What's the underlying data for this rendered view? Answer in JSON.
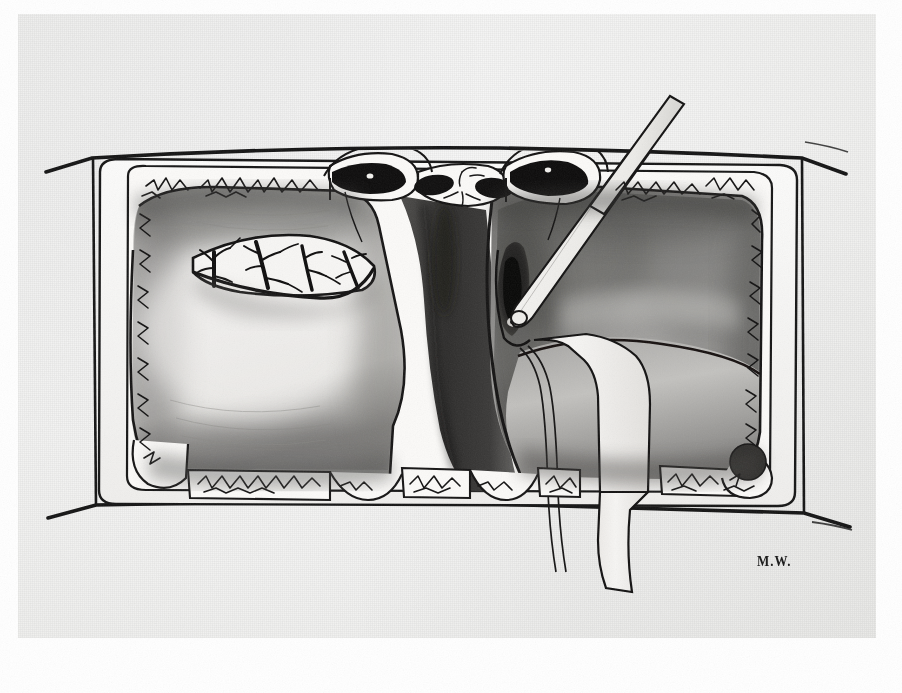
{
  "artwork": {
    "kind": "surgical-operative-illustration",
    "medium": "pen-and-ink wash drawing on textured paper",
    "signature": "M.W.",
    "signature_position": "lower-right",
    "background_color": "#f4f4f3",
    "ink_color": "#141414",
    "paper_tone": "#f2f2f0",
    "view": "operative field seen through a draped incision"
  },
  "scene": {
    "title": "Operative field exposure",
    "elements": [
      {
        "name": "surgical-drape-frame",
        "label": "Surgical drape / towels sutured to wound edges",
        "description": "Rounded rectangular frame of pale cloth surrounding the exposed field, its inner border marked by running suture stitches."
      },
      {
        "name": "skin-incision-outline",
        "label": "Skin and fascial incision margin",
        "description": "Heavy ink outline running outside the drape, angled slightly at the upper-left and lower-right corners."
      },
      {
        "name": "left-tissue-mass",
        "label": "Left mobilised tissue mass",
        "description": "Large pale lobed mass occupying the left half of the field, shaded with grey wash at its inferior and lateral borders."
      },
      {
        "name": "right-tissue-mass",
        "label": "Right tissue mass / retracted lobe",
        "description": "Darker, heavily washed mass filling the right half of the field."
      },
      {
        "name": "vascular-window",
        "label": "Opened vascular plane with branching vessels",
        "description": "Lens-shaped opening on the superior surface of the left mass revealing a branching arborised vessel pattern drawn in fine black ink."
      },
      {
        "name": "midline-cleft",
        "label": "Midline cleft / dissection plane",
        "description": "Deep dark sulcus descending down the centre of the field between the two masses."
      },
      {
        "name": "clamped-pedicles",
        "label": "Clamped and ligated pedicles",
        "description": "Two dense black clamped structures at the superior margin, each encircled by outlined cuff tissue and fixed with fine sutures."
      },
      {
        "name": "dissecting-probe",
        "label": "Dissecting probe / blunt elevator",
        "description": "Long slender instrument entering from upper right, its rounded blunt tip placed in a dark defect on the right mass."
      },
      {
        "name": "tissue-defect",
        "label": "Dark defect / opened cavity",
        "description": "Irregular black cavity beneath the probe tip on the right mass."
      },
      {
        "name": "retraction-tape",
        "label": "Retraction tape / vessel loop",
        "description": "Broad pale band passing from the centre of the field down and out through the lower border of the drawing."
      },
      {
        "name": "thin-traction-suture",
        "label": "Traction suture",
        "description": "Fine double line running parallel to the retraction tape and exiting the field below."
      },
      {
        "name": "suture-stitches",
        "label": "Running suture stitches",
        "description": "Zig-zag stitch marks drawn along every drape border, densest along the top and bottom edges."
      },
      {
        "name": "scalloped-drape-edge",
        "label": "Scalloped lower drape edge",
        "description": "Series of rounded lobes along the inferior drape where tissue bulges between fixation points."
      }
    ]
  }
}
